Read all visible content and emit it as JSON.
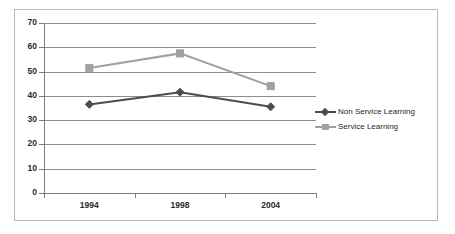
{
  "chart_data": {
    "type": "line",
    "title": "",
    "xlabel": "",
    "ylabel": "",
    "categories": [
      "1994",
      "1998",
      "2004"
    ],
    "ylim": [
      0,
      70
    ],
    "ytick_labels": [
      "70",
      "60",
      "50",
      "40",
      "30",
      "20",
      "10",
      "0"
    ],
    "ytick_values": [
      70,
      60,
      50,
      40,
      30,
      20,
      10,
      0
    ],
    "grid": true,
    "legend_position": "right",
    "series": [
      {
        "name": "Non Service Learning",
        "values": [
          36.5,
          41.5,
          35.5
        ],
        "color": "#4d4d4d",
        "marker": "diamond"
      },
      {
        "name": "Service Learning",
        "values": [
          51.5,
          57.5,
          44.0
        ],
        "color": "#a0a0a0",
        "marker": "square"
      }
    ]
  },
  "legend": {
    "items": [
      {
        "label": "Non Service Learning",
        "color": "#4d4d4d",
        "marker": "diamond-icon"
      },
      {
        "label": "Service Learning",
        "color": "#a0a0a0",
        "marker": "square-icon"
      }
    ]
  },
  "colors": {
    "grid": "#8d8d8d",
    "axis": "#7d7d7d",
    "frame": "#b9b9b9",
    "text": "#2b2b2b",
    "background": "#ffffff"
  }
}
